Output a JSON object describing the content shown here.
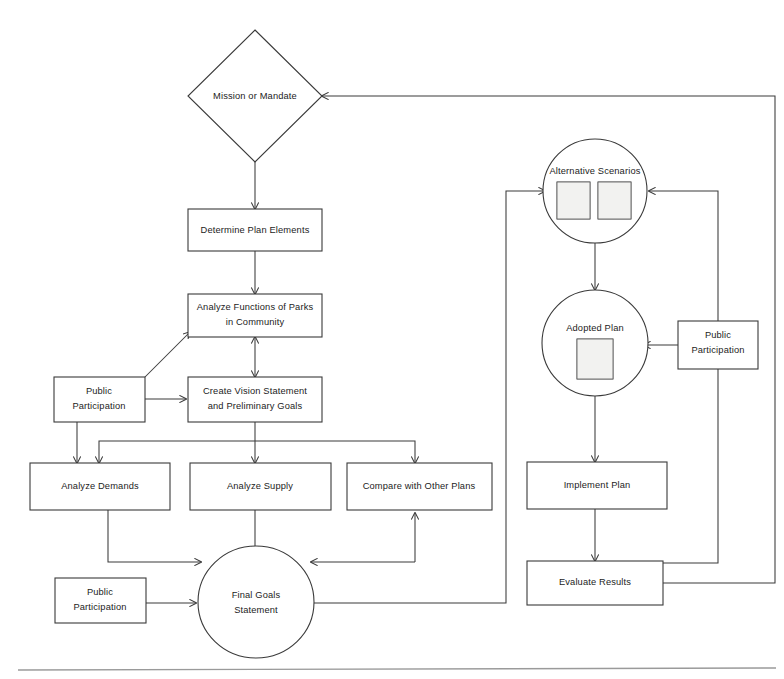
{
  "diagram": {
    "nodes": {
      "mission": {
        "label": "Mission or Mandate",
        "shape": "diamond"
      },
      "determine": {
        "label": "Determine Plan Elements",
        "shape": "rect"
      },
      "analyze_functions": {
        "label_line1": "Analyze Functions of Parks",
        "label_line2": "in Community",
        "shape": "rect"
      },
      "public_participation_left": {
        "label_line1": "Public",
        "label_line2": "Participation",
        "shape": "rect"
      },
      "create_vision": {
        "label_line1": "Create Vision Statement",
        "label_line2": "and Preliminary Goals",
        "shape": "rect"
      },
      "analyze_demands": {
        "label": "Analyze Demands",
        "shape": "rect"
      },
      "analyze_supply": {
        "label": "Analyze Supply",
        "shape": "rect"
      },
      "compare_other_plans": {
        "label": "Compare with Other Plans",
        "shape": "rect"
      },
      "public_participation_bottom": {
        "label_line1": "Public",
        "label_line2": "Participation",
        "shape": "rect"
      },
      "final_goals": {
        "label_line1": "Final Goals",
        "label_line2": "Statement",
        "shape": "ellipse"
      },
      "alternative_scenarios": {
        "label": "Alternative Scenarios",
        "shape": "circle",
        "thumbnails": 2
      },
      "adopted_plan": {
        "label": "Adopted Plan",
        "shape": "circle",
        "thumbnails": 1
      },
      "public_participation_right": {
        "label_line1": "Public",
        "label_line2": "Participation",
        "shape": "rect"
      },
      "implement_plan": {
        "label": "Implement Plan",
        "shape": "rect"
      },
      "evaluate_results": {
        "label": "Evaluate Results",
        "shape": "rect"
      }
    },
    "edges": [
      {
        "from": "mission",
        "to": "determine",
        "style": "single-arrow"
      },
      {
        "from": "determine",
        "to": "analyze_functions",
        "style": "single-arrow"
      },
      {
        "from": "analyze_functions",
        "to": "create_vision",
        "style": "double-arrow"
      },
      {
        "from": "public_participation_left",
        "to": "analyze_functions",
        "style": "single-arrow"
      },
      {
        "from": "public_participation_left",
        "to": "create_vision",
        "style": "single-arrow"
      },
      {
        "from": "public_participation_left",
        "to": "analyze_demands",
        "style": "single-arrow"
      },
      {
        "from": "create_vision",
        "to": "analyze_demands",
        "style": "single-arrow"
      },
      {
        "from": "create_vision",
        "to": "analyze_supply",
        "style": "single-arrow"
      },
      {
        "from": "create_vision",
        "to": "compare_other_plans",
        "style": "single-arrow"
      },
      {
        "from": "analyze_demands",
        "to": "final_goals",
        "style": "single-arrow"
      },
      {
        "from": "analyze_supply",
        "to": "final_goals",
        "style": "single-arrow"
      },
      {
        "from": "compare_other_plans",
        "to": "final_goals",
        "style": "single-arrow"
      },
      {
        "from": "final_goals",
        "to": "compare_other_plans",
        "style": "single-arrow"
      },
      {
        "from": "public_participation_bottom",
        "to": "final_goals",
        "style": "single-arrow"
      },
      {
        "from": "final_goals",
        "to": "alternative_scenarios",
        "style": "single-arrow"
      },
      {
        "from": "alternative_scenarios",
        "to": "adopted_plan",
        "style": "single-arrow"
      },
      {
        "from": "public_participation_right",
        "to": "adopted_plan",
        "style": "single-arrow"
      },
      {
        "from": "adopted_plan",
        "to": "implement_plan",
        "style": "single-arrow"
      },
      {
        "from": "implement_plan",
        "to": "evaluate_results",
        "style": "single-arrow"
      },
      {
        "from": "evaluate_results",
        "to": "alternative_scenarios",
        "style": "single-arrow"
      },
      {
        "from": "evaluate_results",
        "to": "mission",
        "style": "single-arrow"
      }
    ],
    "colors": {
      "stroke": "#3a3a3a",
      "text": "#1c1c1c",
      "background": "#ffffff",
      "rule": "#9a9a9a"
    }
  }
}
